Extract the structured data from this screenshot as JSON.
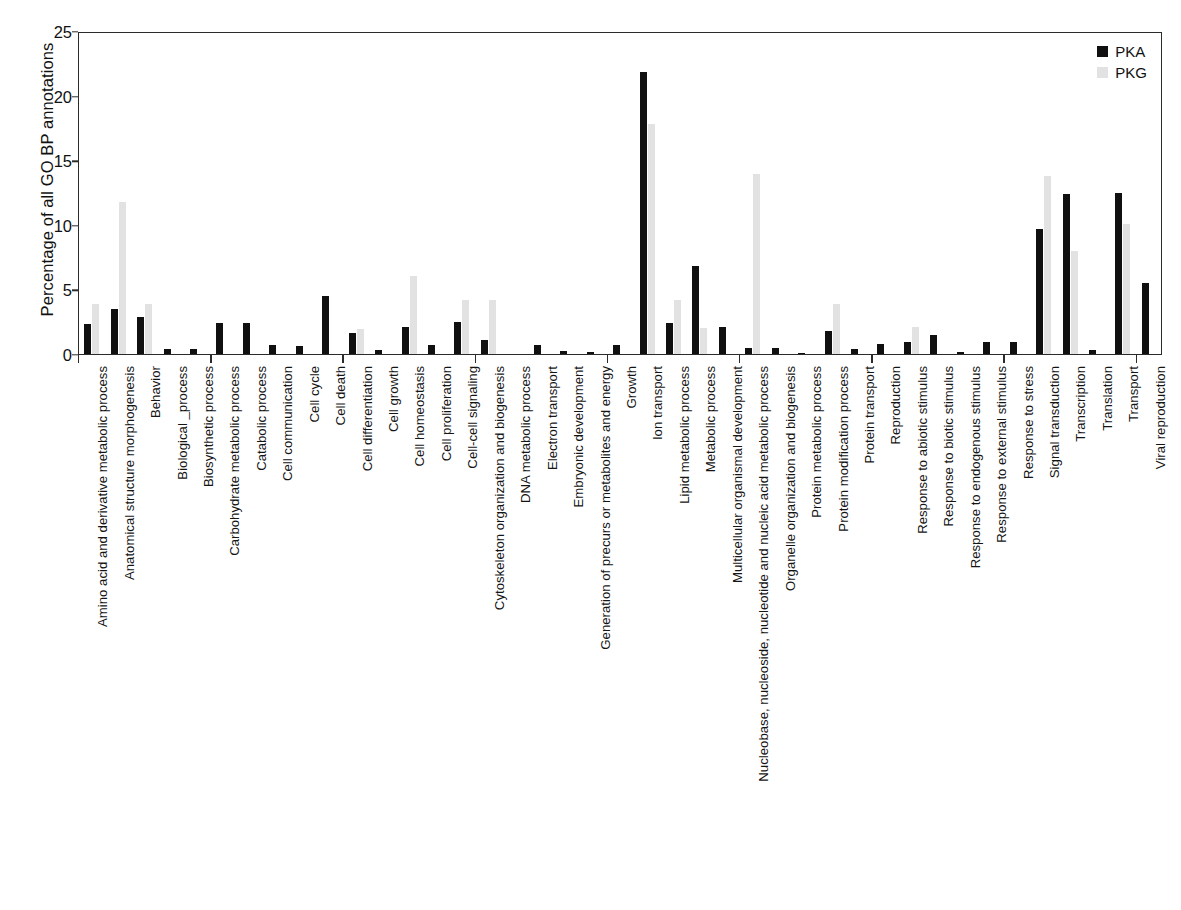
{
  "chart_data": {
    "type": "bar",
    "title": "",
    "xlabel": "",
    "ylabel": "Percentage of all GO BP annotations",
    "ylim": [
      0,
      25
    ],
    "yticks": [
      0,
      5,
      10,
      15,
      20,
      25
    ],
    "grid": false,
    "legend_position": "top-right",
    "colors": {
      "PKA": "#101010",
      "PKG": "#e2e2e2"
    },
    "categories": [
      "Amino acid and derivative metabolic process",
      "Anatomical structure morphogenesis",
      "Behavior",
      "Biological _process",
      "Biosynthetic process",
      "Carbohydrate metabolic process",
      "Catabolic process",
      "Cell communication",
      "Cell cycle",
      "Cell death",
      "Cell differentiation",
      "Cell growth",
      "Cell homeostasis",
      "Cell proliferation",
      "Cell-cell signaling",
      "Cytoskeleton organization and biogenesis",
      "DNA metabolic process",
      "Electron transport",
      "Embryonic development",
      "Generation of precurs or metabolites and energy",
      "Growth",
      "Ion transport",
      "Lipid metabolic process",
      "Metabolic process",
      "Multicellular organismal development",
      "Nucleobase, nucleoside, nucleotide and nucleic acid metabolic process",
      "Organelle organization and biogenesis",
      "Protein metabolic process",
      "Protein modification process",
      "Protein transport",
      "Reproduction",
      "Response to abiotic stimulus",
      "Response to biotic stimulus",
      "Response to endogenous stimulus",
      "Response to external stimulus",
      "Response to stress",
      "Signal transduction",
      "Transcription",
      "Translation",
      "Transport",
      "Viral reproduction"
    ],
    "series": [
      {
        "name": "PKA",
        "values": [
          2.3,
          3.5,
          2.9,
          0.35,
          0.35,
          2.4,
          2.4,
          0.7,
          0.6,
          4.5,
          1.6,
          0.3,
          2.1,
          0.7,
          2.5,
          1.1,
          0.0,
          0.7,
          0.25,
          0.15,
          0.7,
          21.8,
          2.4,
          6.8,
          2.1,
          0.5,
          0.5,
          0.1,
          1.8,
          0.35,
          0.8,
          0.9,
          1.5,
          0.15,
          0.95,
          0.9,
          9.7,
          12.4,
          0.3,
          12.5,
          5.5
        ]
      },
      {
        "name": "PKG",
        "values": [
          3.9,
          11.8,
          3.9,
          0.0,
          0.0,
          0.0,
          0.0,
          0.0,
          0.0,
          0.0,
          1.9,
          0.0,
          6.0,
          0.0,
          4.2,
          4.2,
          0.0,
          0.0,
          0.0,
          0.0,
          0.0,
          17.8,
          4.2,
          2.0,
          0.0,
          13.9,
          0.0,
          0.0,
          3.9,
          0.0,
          0.0,
          2.1,
          0.0,
          0.0,
          0.0,
          0.0,
          13.8,
          8.0,
          0.0,
          10.1,
          0.0
        ]
      }
    ]
  },
  "legend": {
    "items": [
      {
        "label": "PKA",
        "color": "#101010"
      },
      {
        "label": "PKG",
        "color": "#e2e2e2"
      }
    ]
  },
  "axis": {
    "y_title": "Percentage of all GO BP annotations"
  },
  "caption": ""
}
